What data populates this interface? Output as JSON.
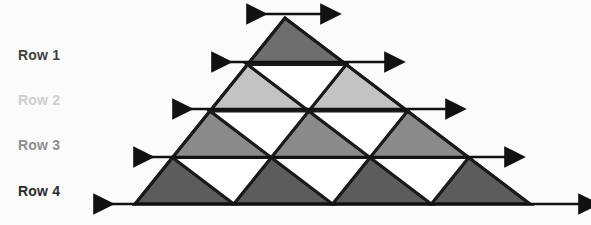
{
  "figure": {
    "background_color": "#fbfbfb",
    "outline_color": "#1a1a1a",
    "arrow_color": "#111111",
    "apex": {
      "x": 285,
      "y": 18
    },
    "base_left": {
      "x": 135,
      "y": 204
    },
    "base_right": {
      "x": 530,
      "y": 204
    }
  },
  "labels": [
    {
      "text": "Row 1",
      "color": "#3f3f3f",
      "x": 18,
      "y": 47
    },
    {
      "text": "Row 2",
      "color": "#cfcfcf",
      "x": 18,
      "y": 92
    },
    {
      "text": "Row 3",
      "color": "#8f8f8f",
      "x": 18,
      "y": 137
    },
    {
      "text": "Row 4",
      "color": "#2b2b2b",
      "x": 18,
      "y": 183
    }
  ],
  "rows": [
    {
      "name": "Row 1",
      "index": 1,
      "up_triangle_count": 1,
      "down_triangle_count": 0,
      "fill": "#6e6e6e",
      "line_y": 62,
      "arrow": {
        "x1": 213,
        "x2": 386,
        "y": 62
      }
    },
    {
      "name": "Row 2",
      "index": 2,
      "up_triangle_count": 2,
      "down_triangle_count": 1,
      "fill": "#c3c3c3",
      "line_y": 109,
      "arrow": {
        "x1": 174,
        "x2": 447,
        "y": 109
      }
    },
    {
      "name": "Row 3",
      "index": 3,
      "up_triangle_count": 3,
      "down_triangle_count": 2,
      "fill": "#8a8a8a",
      "line_y": 157,
      "arrow": {
        "x1": 135,
        "x2": 506,
        "y": 157
      }
    },
    {
      "name": "Row 4",
      "index": 4,
      "up_triangle_count": 4,
      "down_triangle_count": 3,
      "fill": "#5c5c5c",
      "line_y": 204,
      "arrow": {
        "x1": 95,
        "x2": 580,
        "y": 204
      }
    }
  ],
  "apex_arrow": {
    "x1": 248,
    "x2": 322,
    "y": 14
  },
  "down_triangle_fill": "#ffffff"
}
